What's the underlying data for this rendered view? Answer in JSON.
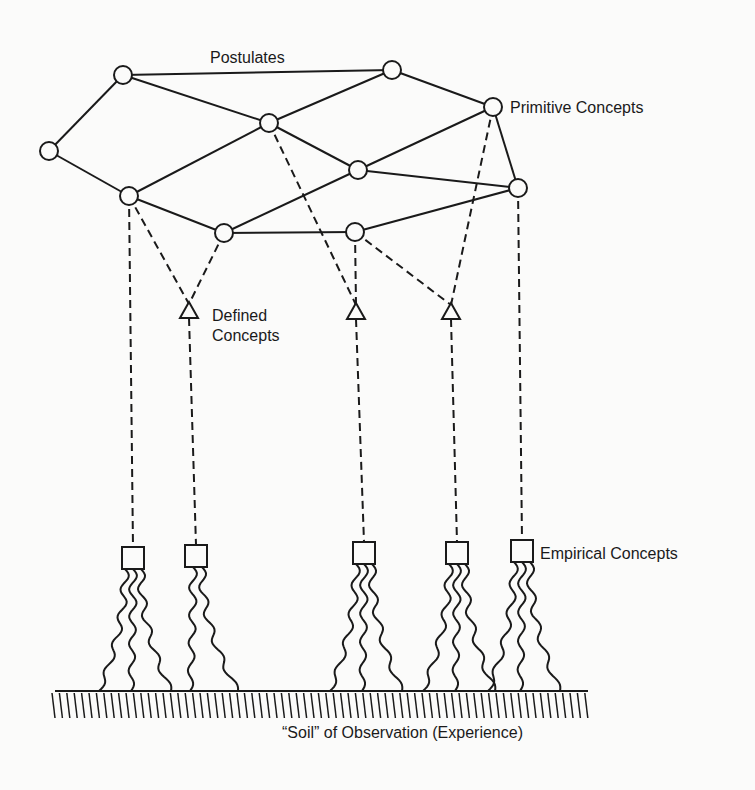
{
  "labels": {
    "postulates": "Postulates",
    "primitive": "Primitive Concepts",
    "defined_line1": "Defined",
    "defined_line2": "Concepts",
    "empirical": "Empirical Concepts",
    "soil": "“Soil” of Observation (Experience)"
  },
  "colors": {
    "ink": "#1a1a1a",
    "background": "#fbfbfa"
  },
  "nodes": {
    "primitive": [
      {
        "id": "A",
        "x": 123,
        "y": 75
      },
      {
        "id": "B",
        "x": 392,
        "y": 70
      },
      {
        "id": "C",
        "x": 493,
        "y": 107
      },
      {
        "id": "D",
        "x": 269,
        "y": 123
      },
      {
        "id": "E",
        "x": 49,
        "y": 151
      },
      {
        "id": "F",
        "x": 358,
        "y": 170
      },
      {
        "id": "G",
        "x": 129,
        "y": 196
      },
      {
        "id": "H",
        "x": 518,
        "y": 188
      },
      {
        "id": "I",
        "x": 224,
        "y": 233
      },
      {
        "id": "J",
        "x": 355,
        "y": 232
      }
    ],
    "defined": [
      {
        "id": "T1",
        "x": 189,
        "y": 312
      },
      {
        "id": "T2",
        "x": 356,
        "y": 313
      },
      {
        "id": "T3",
        "x": 451,
        "y": 313
      }
    ],
    "empirical": [
      {
        "id": "S1",
        "x": 133,
        "y": 558
      },
      {
        "id": "S2",
        "x": 196,
        "y": 556
      },
      {
        "id": "S3",
        "x": 364,
        "y": 553
      },
      {
        "id": "S4",
        "x": 457,
        "y": 553
      },
      {
        "id": "S5",
        "x": 522,
        "y": 551
      }
    ]
  },
  "postulate_edges": [
    [
      "A",
      "B"
    ],
    [
      "A",
      "E"
    ],
    [
      "A",
      "D"
    ],
    [
      "B",
      "D"
    ],
    [
      "B",
      "C"
    ],
    [
      "D",
      "F"
    ],
    [
      "D",
      "G"
    ],
    [
      "C",
      "F"
    ],
    [
      "C",
      "H"
    ],
    [
      "E",
      "G"
    ],
    [
      "G",
      "I"
    ],
    [
      "F",
      "I"
    ],
    [
      "F",
      "H"
    ],
    [
      "I",
      "J"
    ],
    [
      "J",
      "H"
    ]
  ],
  "rules_of_correspondence": [
    [
      "G",
      "S1"
    ],
    [
      "G",
      "T1"
    ],
    [
      "I",
      "T1"
    ],
    [
      "T1",
      "S2"
    ],
    [
      "D",
      "T2"
    ],
    [
      "J",
      "T2"
    ],
    [
      "T2",
      "S3"
    ],
    [
      "J",
      "T3"
    ],
    [
      "C",
      "T3"
    ],
    [
      "T3",
      "S4"
    ],
    [
      "H",
      "S5"
    ]
  ],
  "ground": {
    "x1": 55,
    "x2": 588,
    "y": 691
  }
}
